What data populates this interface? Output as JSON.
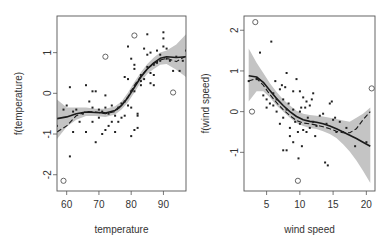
{
  "chart_data": [
    {
      "type": "scatter",
      "title": "",
      "xlabel": "temperature",
      "ylabel": "f(temperature)",
      "xlim": [
        57,
        97
      ],
      "ylim": [
        -2.4,
        1.9
      ],
      "xticks": [
        60,
        70,
        80,
        90
      ],
      "yticks": [
        -2,
        -1,
        0,
        1
      ],
      "grid": false,
      "legend": "none",
      "frame": {
        "x0": 57,
        "x1": 186,
        "y0": 16,
        "y1": 191
      },
      "series": [
        {
          "name": "smooth fit (solid)",
          "style": "solid",
          "x": [
            57,
            60,
            63,
            66,
            69,
            72,
            75,
            77,
            79,
            81,
            83,
            85,
            87,
            89,
            91,
            94,
            97
          ],
          "y": [
            -0.62,
            -0.58,
            -0.5,
            -0.46,
            -0.47,
            -0.48,
            -0.42,
            -0.3,
            -0.1,
            0.15,
            0.4,
            0.6,
            0.75,
            0.86,
            0.9,
            0.88,
            0.9
          ]
        },
        {
          "name": "alternate fit (dashed)",
          "style": "dashed",
          "x": [
            57,
            60,
            63,
            66,
            69,
            72,
            75,
            77,
            79,
            81,
            83,
            85,
            87,
            89,
            91,
            94,
            97
          ],
          "y": [
            -0.95,
            -0.8,
            -0.55,
            -0.45,
            -0.46,
            -0.5,
            -0.45,
            -0.3,
            -0.08,
            0.2,
            0.42,
            0.6,
            0.73,
            0.82,
            0.86,
            0.78,
            0.92
          ]
        },
        {
          "name": "confidence band upper",
          "x": [
            57,
            60,
            63,
            66,
            69,
            72,
            75,
            77,
            79,
            81,
            83,
            85,
            87,
            89,
            91,
            94,
            97
          ],
          "y": [
            -0.15,
            -0.35,
            -0.35,
            -0.35,
            -0.38,
            -0.38,
            -0.32,
            -0.2,
            0.02,
            0.28,
            0.52,
            0.72,
            0.88,
            1.0,
            1.05,
            1.2,
            1.45
          ]
        },
        {
          "name": "confidence band lower",
          "x": [
            57,
            60,
            63,
            66,
            69,
            72,
            75,
            77,
            79,
            81,
            83,
            85,
            87,
            89,
            91,
            94,
            97
          ],
          "y": [
            -1.12,
            -0.82,
            -0.65,
            -0.56,
            -0.56,
            -0.58,
            -0.52,
            -0.4,
            -0.22,
            0.02,
            0.28,
            0.48,
            0.6,
            0.7,
            0.72,
            0.58,
            0.4
          ]
        },
        {
          "name": "partial residuals",
          "marker": "dot",
          "x": [
            57,
            59,
            60,
            61,
            61,
            62,
            62,
            63,
            64,
            65,
            66,
            66,
            67,
            68,
            68,
            68,
            69,
            69,
            70,
            70,
            71,
            71,
            72,
            72,
            72,
            73,
            73,
            74,
            74,
            75,
            75,
            76,
            76,
            77,
            77,
            78,
            78,
            78,
            79,
            79,
            79,
            80,
            80,
            80,
            80,
            81,
            81,
            81,
            81,
            82,
            82,
            82,
            83,
            83,
            83,
            84,
            84,
            85,
            85,
            85,
            86,
            86,
            86,
            87,
            87,
            87,
            88,
            88,
            89,
            89,
            90,
            90,
            90,
            91,
            91,
            92,
            93,
            94,
            95,
            96,
            97
          ],
          "y": [
            -0.8,
            -0.4,
            -0.3,
            0.15,
            -1.55,
            -0.45,
            -0.95,
            -0.4,
            -0.7,
            -0.5,
            0.2,
            -0.95,
            -0.2,
            0.05,
            -0.35,
            -0.7,
            0.05,
            -1.2,
            -0.6,
            -0.4,
            -1.0,
            -0.45,
            -0.05,
            -0.9,
            -0.35,
            -0.8,
            -0.5,
            -0.3,
            -0.7,
            -0.95,
            -0.55,
            -0.35,
            -0.7,
            -0.6,
            -0.25,
            0.4,
            -0.2,
            -0.55,
            1.15,
            0.35,
            -0.3,
            0.85,
            -0.35,
            -1.05,
            0.05,
            0.7,
            0.6,
            -0.9,
            0.05,
            -0.5,
            -0.55,
            -0.85,
            0.3,
            0.45,
            0.2,
            1.1,
            0.35,
            1.45,
            0.95,
            0.65,
            0.25,
            0.5,
            1.0,
            0.45,
            0.2,
            0.7,
            1.05,
            0.75,
            0.95,
            0.8,
            1.5,
            1.35,
            1.15,
            1.1,
            0.85,
            0.8,
            0.55,
            0.9,
            0.55,
            0.8,
            1.05
          ]
        },
        {
          "name": "outliers",
          "marker": "open-circle",
          "x": [
            59,
            72,
            81,
            93
          ],
          "y": [
            -2.15,
            0.9,
            1.42,
            0.02
          ]
        }
      ]
    },
    {
      "type": "scatter",
      "title": "",
      "xlabel": "wind speed",
      "ylabel": "f(wind speed)",
      "xlim": [
        1.6,
        21.3
      ],
      "ylim": [
        -1.95,
        2.35
      ],
      "xticks": [
        5,
        10,
        15,
        20
      ],
      "yticks": [
        -1,
        0,
        1,
        2
      ],
      "grid": false,
      "legend": "none",
      "frame": {
        "x0": 244,
        "x1": 375,
        "y0": 16,
        "y1": 191
      },
      "series": [
        {
          "name": "smooth fit (solid)",
          "style": "solid",
          "x": [
            2.3,
            3.5,
            4.5,
            5.5,
            6.5,
            7.5,
            8.5,
            9.5,
            10.5,
            11.5,
            12.5,
            13.5,
            14.5,
            15.5,
            16.5,
            17.5,
            18.5,
            19.5,
            20.6
          ],
          "y": [
            0.88,
            0.85,
            0.72,
            0.52,
            0.32,
            0.15,
            0.0,
            -0.12,
            -0.2,
            -0.24,
            -0.26,
            -0.3,
            -0.35,
            -0.42,
            -0.5,
            -0.58,
            -0.66,
            -0.75,
            -0.85
          ]
        },
        {
          "name": "alternate fit (dashed)",
          "style": "dashed",
          "x": [
            2.3,
            3.5,
            4.5,
            5.5,
            6.5,
            7.5,
            8.5,
            9.5,
            10.5,
            11.5,
            12.5,
            13.5,
            14.5,
            15.5,
            16.5,
            17.5,
            18.5,
            19.5,
            20.6
          ],
          "y": [
            0.75,
            0.82,
            0.65,
            0.42,
            0.22,
            0.05,
            -0.1,
            -0.22,
            -0.28,
            -0.3,
            -0.33,
            -0.37,
            -0.42,
            -0.48,
            -0.52,
            -0.52,
            -0.42,
            -0.2,
            0.0
          ]
        },
        {
          "name": "confidence band upper",
          "x": [
            2.3,
            3.5,
            4.5,
            5.5,
            6.5,
            7.5,
            8.5,
            9.5,
            10.5,
            11.5,
            12.5,
            13.5,
            14.5,
            15.5,
            16.5,
            17.5,
            18.5,
            19.5,
            20.6
          ],
          "y": [
            1.55,
            1.2,
            0.95,
            0.7,
            0.48,
            0.3,
            0.15,
            0.02,
            -0.05,
            -0.08,
            -0.1,
            -0.12,
            -0.15,
            -0.18,
            -0.22,
            -0.25,
            -0.15,
            -0.05,
            0.1
          ]
        },
        {
          "name": "confidence band lower",
          "x": [
            2.3,
            3.5,
            4.5,
            5.5,
            6.5,
            7.5,
            8.5,
            9.5,
            10.5,
            11.5,
            12.5,
            13.5,
            14.5,
            15.5,
            16.5,
            17.5,
            18.5,
            19.5,
            20.6
          ],
          "y": [
            0.25,
            0.5,
            0.5,
            0.35,
            0.15,
            0.0,
            -0.15,
            -0.28,
            -0.35,
            -0.4,
            -0.43,
            -0.48,
            -0.55,
            -0.65,
            -0.8,
            -0.98,
            -1.2,
            -1.45,
            -1.75
          ]
        },
        {
          "name": "partial residuals",
          "marker": "dot",
          "x": [
            2.3,
            3.5,
            4,
            4.5,
            5,
            5,
            5.5,
            5.7,
            6,
            6,
            6.3,
            6.5,
            6.5,
            7,
            7,
            7.3,
            7.5,
            7.5,
            7.5,
            7.8,
            8,
            8,
            8,
            8.3,
            8.5,
            8.5,
            9,
            9,
            9,
            9.3,
            9.5,
            9.7,
            9.8,
            10,
            10,
            10,
            10.2,
            10.3,
            10.5,
            10.5,
            10.8,
            11,
            11,
            11.2,
            11.5,
            11.5,
            11.8,
            12,
            12,
            12.3,
            12.5,
            13,
            13.5,
            13.8,
            14,
            14.2,
            14.5,
            14.8,
            15,
            15.3,
            15.5,
            16,
            16.5,
            17,
            18.3,
            20
          ],
          "y": [
            0.75,
            0.8,
            1.45,
            0.4,
            0.3,
            0.1,
            0.2,
            1.72,
            0.45,
            0.15,
            0.75,
            0.3,
            0.0,
            0.55,
            -0.3,
            0.65,
            0.3,
            -0.15,
            -0.95,
            0.6,
            0.95,
            0.05,
            -0.95,
            0.2,
            -0.4,
            -0.6,
            0.5,
            0.05,
            -0.75,
            -0.25,
            0.8,
            -0.5,
            -1.15,
            0.5,
            0.0,
            -0.3,
            0.1,
            -0.85,
            0.35,
            -0.45,
            0.1,
            0.25,
            -0.5,
            -0.15,
            0.15,
            -0.4,
            0.3,
            0.45,
            -0.25,
            -0.6,
            -0.35,
            -0.1,
            -0.05,
            -1.25,
            -0.3,
            -1.32,
            0.2,
            0.25,
            -0.2,
            -0.15,
            -0.5,
            -0.25,
            -0.5,
            -0.4,
            -0.85,
            -0.75
          ]
        },
        {
          "name": "outliers",
          "marker": "open-circle",
          "x": [
            3.3,
            2.8,
            9.7,
            20.8
          ],
          "y": [
            2.2,
            0.0,
            -1.7,
            0.57
          ]
        }
      ]
    }
  ],
  "panels": [
    {
      "xlabel": "temperature",
      "ylabel": "f(temperature)",
      "xticks": [
        "60",
        "70",
        "80",
        "90"
      ],
      "yticks": [
        "-2",
        "-1",
        "0",
        "1"
      ]
    },
    {
      "xlabel": "wind speed",
      "ylabel": "f(wind speed)",
      "xticks": [
        "5",
        "10",
        "15",
        "20"
      ],
      "yticks": [
        "-1",
        "0",
        "1",
        "2"
      ]
    }
  ],
  "colors": {
    "band": "#c4c4c4",
    "line": "#1a1a1a",
    "points": "#222222",
    "frame": "#555555"
  }
}
